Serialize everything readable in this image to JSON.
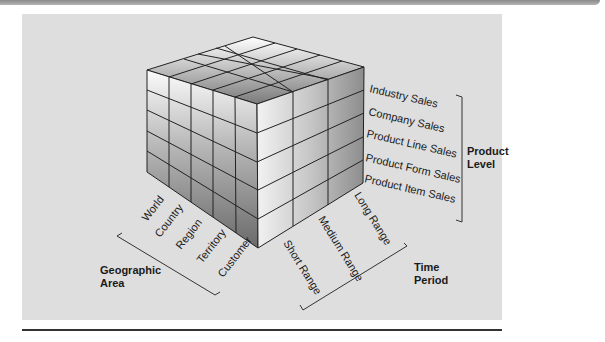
{
  "diagram": {
    "type": "3d-cube",
    "product_level": {
      "title": [
        "Product",
        "Level"
      ],
      "items": [
        "Industry Sales",
        "Company Sales",
        "Product Line Sales",
        "Product Form Sales",
        "Product Item Sales"
      ]
    },
    "geographic_area": {
      "title": [
        "Geographic",
        "Area"
      ],
      "items": [
        "World",
        "Country",
        "Region",
        "Territory",
        "Customer"
      ]
    },
    "time_period": {
      "title": [
        "Time",
        "Period"
      ],
      "items": [
        "Short Range",
        "Medium Range",
        "Long Range"
      ]
    }
  }
}
